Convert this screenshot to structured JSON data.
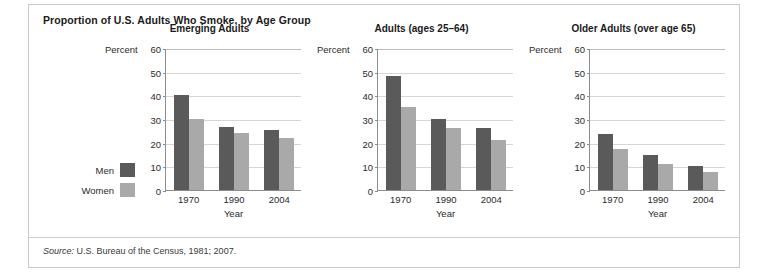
{
  "figure": {
    "title": "Proportion of U.S. Adults Who Smoke, by Age Group",
    "source_word": "Source:",
    "source_text": " U.S. Bureau of the Census, 1981; 2007."
  },
  "legend": {
    "items": [
      {
        "label": "Men",
        "color": "#5a5a5a"
      },
      {
        "label": "Women",
        "color": "#a9a9a9"
      }
    ]
  },
  "colors": {
    "men": "#5a5a5a",
    "women": "#a9a9a9",
    "axis": "#8c8c8c",
    "grid": "#d6d6d6",
    "frame": "#c9c9c9"
  },
  "axis": {
    "unit_label": "Percent",
    "xlabel": "Year",
    "yticks": [
      0,
      10,
      20,
      30,
      40,
      50,
      60
    ],
    "categories": [
      "1970",
      "1990",
      "2004"
    ]
  },
  "chart_data": [
    {
      "type": "bar",
      "title": "Emerging Adults",
      "categories": [
        "1970",
        "1990",
        "2004"
      ],
      "series": [
        {
          "name": "Men",
          "values": [
            40,
            26.5,
            25.5
          ]
        },
        {
          "name": "Women",
          "values": [
            30,
            24,
            22
          ]
        }
      ],
      "xlabel": "Year",
      "ylabel": "Percent",
      "ylim": [
        0,
        60
      ],
      "yticks": [
        0,
        10,
        20,
        30,
        40,
        50,
        60
      ],
      "grid": true,
      "legend_position": "left-outside"
    },
    {
      "type": "bar",
      "title": "Adults (ages 25–64)",
      "categories": [
        "1970",
        "1990",
        "2004"
      ],
      "series": [
        {
          "name": "Men",
          "values": [
            48,
            30,
            26
          ]
        },
        {
          "name": "Women",
          "values": [
            35,
            26,
            21
          ]
        }
      ],
      "xlabel": "Year",
      "ylabel": "Percent",
      "ylim": [
        0,
        60
      ],
      "yticks": [
        0,
        10,
        20,
        30,
        40,
        50,
        60
      ],
      "grid": true,
      "legend_position": "left-outside"
    },
    {
      "type": "bar",
      "title": "Older Adults (over age 65)",
      "categories": [
        "1970",
        "1990",
        "2004"
      ],
      "series": [
        {
          "name": "Men",
          "values": [
            23.5,
            15,
            10
          ]
        },
        {
          "name": "Women",
          "values": [
            17.5,
            11,
            7.5
          ]
        }
      ],
      "xlabel": "Year",
      "ylabel": "Percent",
      "ylim": [
        0,
        60
      ],
      "yticks": [
        0,
        10,
        20,
        30,
        40,
        50,
        60
      ],
      "grid": true,
      "legend_position": "left-outside"
    }
  ]
}
